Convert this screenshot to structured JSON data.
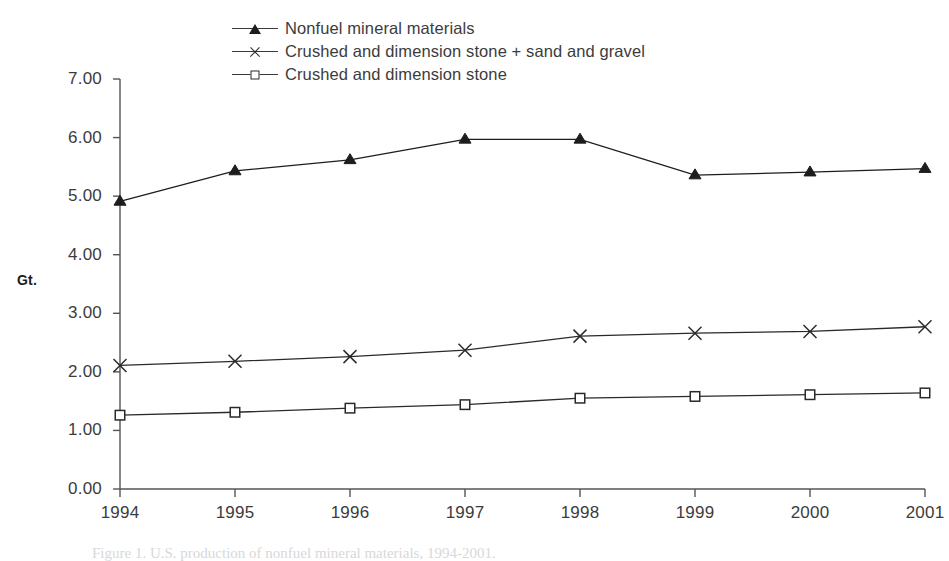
{
  "chart_data": {
    "type": "line",
    "title": "",
    "subtitle": "",
    "xlabel": "",
    "ylabel": "Gt.",
    "categories": [
      "1994",
      "1995",
      "1996",
      "1997",
      "1998",
      "1999",
      "2000",
      "2001"
    ],
    "x": [
      1994,
      1995,
      1996,
      1997,
      1998,
      1999,
      2000,
      2001
    ],
    "ylim": [
      0,
      7
    ],
    "ytick_step": 1,
    "ytick_labels": [
      "0.00",
      "1.00",
      "2.00",
      "3.00",
      "4.00",
      "5.00",
      "6.00",
      "7.00"
    ],
    "ytick_values": [
      0,
      1,
      2,
      3,
      4,
      5,
      6,
      7
    ],
    "grid": false,
    "legend_position": "top-center",
    "series": [
      {
        "name": "Nonfuel mineral materials",
        "marker": "triangle",
        "color": "#1d1d1d",
        "values": [
          4.91,
          5.43,
          5.62,
          5.97,
          5.97,
          5.36,
          5.41,
          5.47
        ]
      },
      {
        "name": "Crushed and dimension stone + sand and gravel",
        "marker": "cross",
        "color": "#2a2a2a",
        "values": [
          2.11,
          2.18,
          2.26,
          2.37,
          2.61,
          2.66,
          2.69,
          2.77
        ]
      },
      {
        "name": "Crushed and dimension stone",
        "marker": "square",
        "color": "#2a2a2a",
        "values": [
          1.26,
          1.31,
          1.38,
          1.44,
          1.55,
          1.58,
          1.61,
          1.64
        ]
      }
    ]
  },
  "legend": {
    "items": [
      {
        "label": "Nonfuel mineral materials",
        "marker": "triangle"
      },
      {
        "label": "Crushed and dimension stone + sand and gravel",
        "marker": "cross"
      },
      {
        "label": "Crushed and dimension stone",
        "marker": "square"
      }
    ]
  },
  "axes": {
    "y_title": "Gt."
  },
  "caption": {
    "text": "Figure 1. U.S. production of nonfuel mineral materials, 1994-2001."
  }
}
